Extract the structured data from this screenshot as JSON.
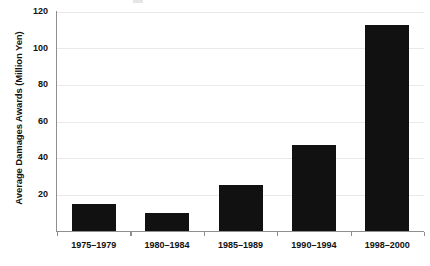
{
  "chart_data": {
    "type": "bar",
    "title": "",
    "xlabel": "",
    "ylabel": "Average Damages Awards (Million Yen)",
    "categories": [
      "1975–1979",
      "1980–1984",
      "1985–1989",
      "1990–1994",
      "1998–2000"
    ],
    "values": [
      15,
      10,
      25,
      47,
      113
    ],
    "ylim": [
      0,
      120
    ],
    "yticks": [
      20,
      40,
      60,
      80,
      100,
      120
    ],
    "ytick_labels": [
      "20",
      "40",
      "60",
      "80",
      "100",
      "120"
    ],
    "grid": true,
    "legend": false,
    "bar_color": "#111111",
    "gridline_color": "#e9e9ec",
    "axis_color": "#8d8d92",
    "background": "#ffffff"
  }
}
